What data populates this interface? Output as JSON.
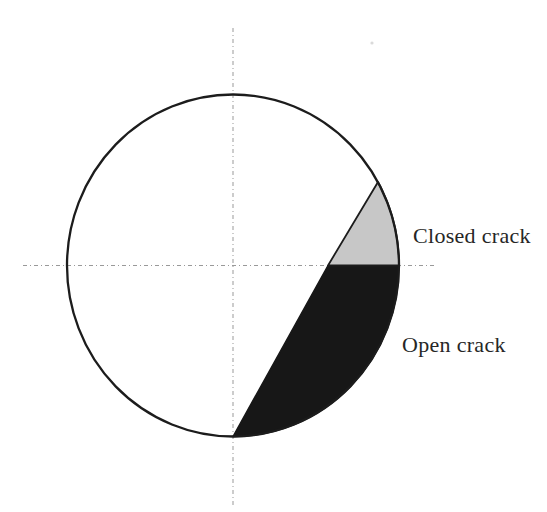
{
  "canvas": {
    "width": 547,
    "height": 512,
    "background": "#ffffff"
  },
  "diagram": {
    "circle": {
      "cx": 233,
      "cy": 265.5,
      "rx": 166,
      "ry": 171,
      "stroke": "#1c1c1c",
      "stroke_width": 2.3
    },
    "axes": {
      "stroke": "#999999",
      "dash": "4 3 1 3",
      "vertical": {
        "x": 233,
        "y1": 28,
        "y2": 505
      },
      "horizontal": {
        "y": 265.5,
        "x1": 23,
        "x2": 436
      }
    },
    "regions": {
      "closed_crack": {
        "fill": "#c7c7c7",
        "stroke": "#1c1c1c",
        "stroke_width": 1.8,
        "path": "M 328 265.5 L 378 182 A 166 171 0 0 1 399 265.5 Z"
      },
      "open_crack": {
        "fill": "#171717",
        "stroke": "#171717",
        "stroke_width": 1.5,
        "path": "M 328 265.5 L 399 265.5 A 166 171 0 0 1 233 436.5 Z"
      }
    },
    "labels": {
      "closed": {
        "text": "Closed crack",
        "x": 413,
        "y": 243,
        "color": "#262626"
      },
      "open": {
        "text": "Open crack",
        "x": 402,
        "y": 352,
        "color": "#262626"
      }
    },
    "speck": {
      "cx": 372,
      "cy": 43,
      "r": 1.6,
      "fill": "#bbbbbb"
    }
  }
}
